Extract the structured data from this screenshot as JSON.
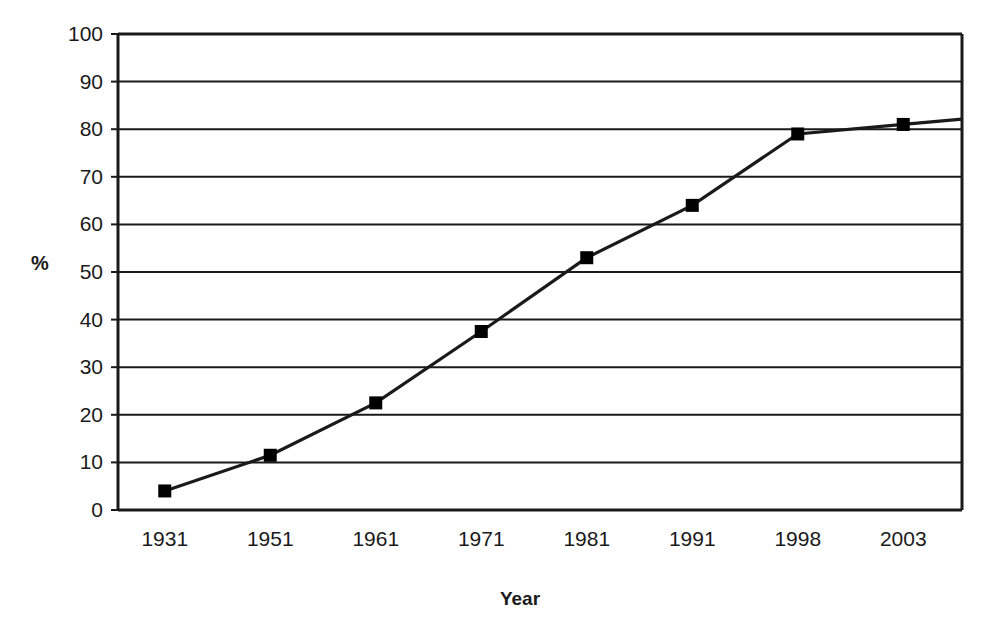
{
  "chart_data": {
    "type": "line",
    "title": "",
    "subtitle": "",
    "xlabel": "Year",
    "ylabel": "%",
    "categories": [
      "1931",
      "1951",
      "1961",
      "1971",
      "1981",
      "1991",
      "1998",
      "2003"
    ],
    "values": [
      4,
      11.5,
      22.5,
      37.5,
      53,
      64,
      79,
      81
    ],
    "series": [
      {
        "name": "",
        "values": [
          4,
          11.5,
          22.5,
          37.5,
          53,
          64,
          79,
          81
        ]
      }
    ],
    "ylim": [
      0,
      100
    ],
    "ytick_labels": [
      "100",
      "90",
      "80",
      "70",
      "60",
      "50",
      "40",
      "30",
      "20",
      "10",
      "0"
    ],
    "ytick_values": [
      100,
      90,
      80,
      70,
      60,
      50,
      40,
      30,
      20,
      10,
      0
    ],
    "ytick_step": 10,
    "grid": "horizontal",
    "legend": "none",
    "marker": "square",
    "marker_color": "#000000",
    "line_color": "#1a1a1a",
    "axis_color": "#1a1a1a",
    "plot_background": "#ffffff",
    "annotations": []
  }
}
